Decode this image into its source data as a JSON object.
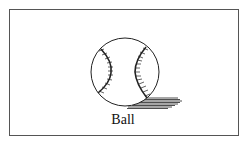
{
  "figure": {
    "caption": "Ball",
    "icon": "baseball-icon",
    "colors": {
      "border": "#555555",
      "stroke": "#222222",
      "background": "#ffffff"
    }
  }
}
